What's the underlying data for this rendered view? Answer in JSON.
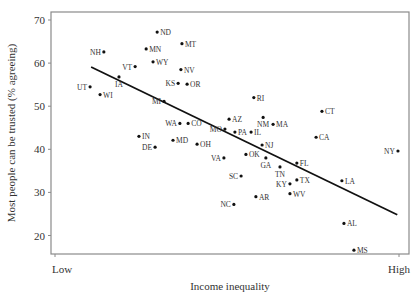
{
  "chart_data": {
    "type": "scatter",
    "title": "",
    "xlabel": "Income inequality",
    "ylabel": "Most people can be trusted (% agreeing)",
    "x_tick_labels": [
      "Low",
      "High"
    ],
    "y_ticks": [
      20,
      30,
      40,
      50,
      60,
      70
    ],
    "ylim": [
      15,
      72
    ],
    "xlim": [
      0,
      1
    ],
    "grid": false,
    "legend": null,
    "trend_line": {
      "x": [
        0.105,
        0.995
      ],
      "y": [
        59.1,
        24.8
      ]
    },
    "points": [
      {
        "state": "ND",
        "x": 0.297,
        "y": 67.2,
        "label_side": "right"
      },
      {
        "state": "MT",
        "x": 0.369,
        "y": 64.5,
        "label_side": "right"
      },
      {
        "state": "MN",
        "x": 0.265,
        "y": 63.3,
        "label_side": "right"
      },
      {
        "state": "NH",
        "x": 0.142,
        "y": 62.6,
        "label_side": "left"
      },
      {
        "state": "WY",
        "x": 0.285,
        "y": 60.3,
        "label_side": "right"
      },
      {
        "state": "VT",
        "x": 0.233,
        "y": 59.2,
        "label_side": "left"
      },
      {
        "state": "NV",
        "x": 0.366,
        "y": 58.5,
        "label_side": "right"
      },
      {
        "state": "IA",
        "x": 0.186,
        "y": 56.8,
        "label_side": "below"
      },
      {
        "state": "KS",
        "x": 0.358,
        "y": 55.3,
        "label_side": "left"
      },
      {
        "state": "OR",
        "x": 0.384,
        "y": 55.1,
        "label_side": "right"
      },
      {
        "state": "UT",
        "x": 0.102,
        "y": 54.5,
        "label_side": "left"
      },
      {
        "state": "WI",
        "x": 0.131,
        "y": 52.7,
        "label_side": "right"
      },
      {
        "state": "RI",
        "x": 0.578,
        "y": 52.0,
        "label_side": "right"
      },
      {
        "state": "MI",
        "x": 0.317,
        "y": 51.1,
        "label_side": "left"
      },
      {
        "state": "CT",
        "x": 0.776,
        "y": 48.8,
        "label_side": "right"
      },
      {
        "state": "NM",
        "x": 0.605,
        "y": 47.4,
        "label_side": "below"
      },
      {
        "state": "AZ",
        "x": 0.506,
        "y": 47.0,
        "label_side": "right"
      },
      {
        "state": "WA",
        "x": 0.363,
        "y": 46.0,
        "label_side": "left"
      },
      {
        "state": "CO",
        "x": 0.387,
        "y": 46.0,
        "label_side": "right"
      },
      {
        "state": "MA",
        "x": 0.634,
        "y": 45.8,
        "label_side": "right"
      },
      {
        "state": "MO",
        "x": 0.494,
        "y": 44.7,
        "label_side": "left"
      },
      {
        "state": "PA",
        "x": 0.523,
        "y": 44.0,
        "label_side": "right"
      },
      {
        "state": "IL",
        "x": 0.57,
        "y": 44.0,
        "label_side": "right"
      },
      {
        "state": "IN",
        "x": 0.244,
        "y": 43.0,
        "label_side": "right"
      },
      {
        "state": "CA",
        "x": 0.759,
        "y": 42.8,
        "label_side": "right"
      },
      {
        "state": "MD",
        "x": 0.343,
        "y": 42.1,
        "label_side": "right"
      },
      {
        "state": "OH",
        "x": 0.413,
        "y": 41.2,
        "label_side": "right"
      },
      {
        "state": "NJ",
        "x": 0.602,
        "y": 41.0,
        "label_side": "right"
      },
      {
        "state": "DE",
        "x": 0.291,
        "y": 40.5,
        "label_side": "left"
      },
      {
        "state": "NY",
        "x": 0.997,
        "y": 39.6,
        "label_side": "left"
      },
      {
        "state": "OK",
        "x": 0.555,
        "y": 38.8,
        "label_side": "right"
      },
      {
        "state": "VA",
        "x": 0.491,
        "y": 38.0,
        "label_side": "left"
      },
      {
        "state": "GA",
        "x": 0.613,
        "y": 38.0,
        "label_side": "below"
      },
      {
        "state": "FL",
        "x": 0.703,
        "y": 36.8,
        "label_side": "right"
      },
      {
        "state": "TN",
        "x": 0.654,
        "y": 35.9,
        "label_side": "below"
      },
      {
        "state": "SC",
        "x": 0.541,
        "y": 33.8,
        "label_side": "left"
      },
      {
        "state": "TX",
        "x": 0.703,
        "y": 32.9,
        "label_side": "right"
      },
      {
        "state": "LA",
        "x": 0.834,
        "y": 32.7,
        "label_side": "right"
      },
      {
        "state": "KY",
        "x": 0.683,
        "y": 32.0,
        "label_side": "left"
      },
      {
        "state": "WV",
        "x": 0.683,
        "y": 29.7,
        "label_side": "right"
      },
      {
        "state": "AR",
        "x": 0.584,
        "y": 29.0,
        "label_side": "right"
      },
      {
        "state": "NC",
        "x": 0.52,
        "y": 27.2,
        "label_side": "left"
      },
      {
        "state": "AL",
        "x": 0.84,
        "y": 22.8,
        "label_side": "right"
      },
      {
        "state": "MS",
        "x": 0.869,
        "y": 16.6,
        "label_side": "right"
      }
    ]
  },
  "axes": {
    "x_title": "Income inequality",
    "y_title": "Most people can be trusted (% agreeing)",
    "x_low": "Low",
    "x_high": "High",
    "y_tick_labels": [
      "70",
      "60",
      "50",
      "40",
      "30",
      "20"
    ]
  }
}
